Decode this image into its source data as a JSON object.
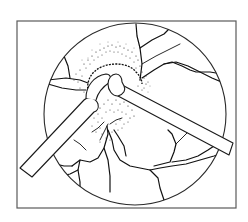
{
  "figure": {
    "title": "",
    "caption": ""
  },
  "colors": {
    "background": "#ffffff",
    "frame_stroke": "#5a5a5a",
    "line": "#111111",
    "stipple": "#2a2a2a"
  },
  "frame": {
    "x": 17,
    "y": 21,
    "width": 219,
    "height": 187
  },
  "fundus_circle": {
    "cx": 135,
    "cy": 114,
    "r": 91
  },
  "instruments": [
    {
      "name": "left-instrument",
      "side": "lower-left",
      "tip": "rounded cup"
    },
    {
      "name": "right-instrument",
      "side": "right",
      "tip": "hooked spatula"
    }
  ],
  "labels": []
}
